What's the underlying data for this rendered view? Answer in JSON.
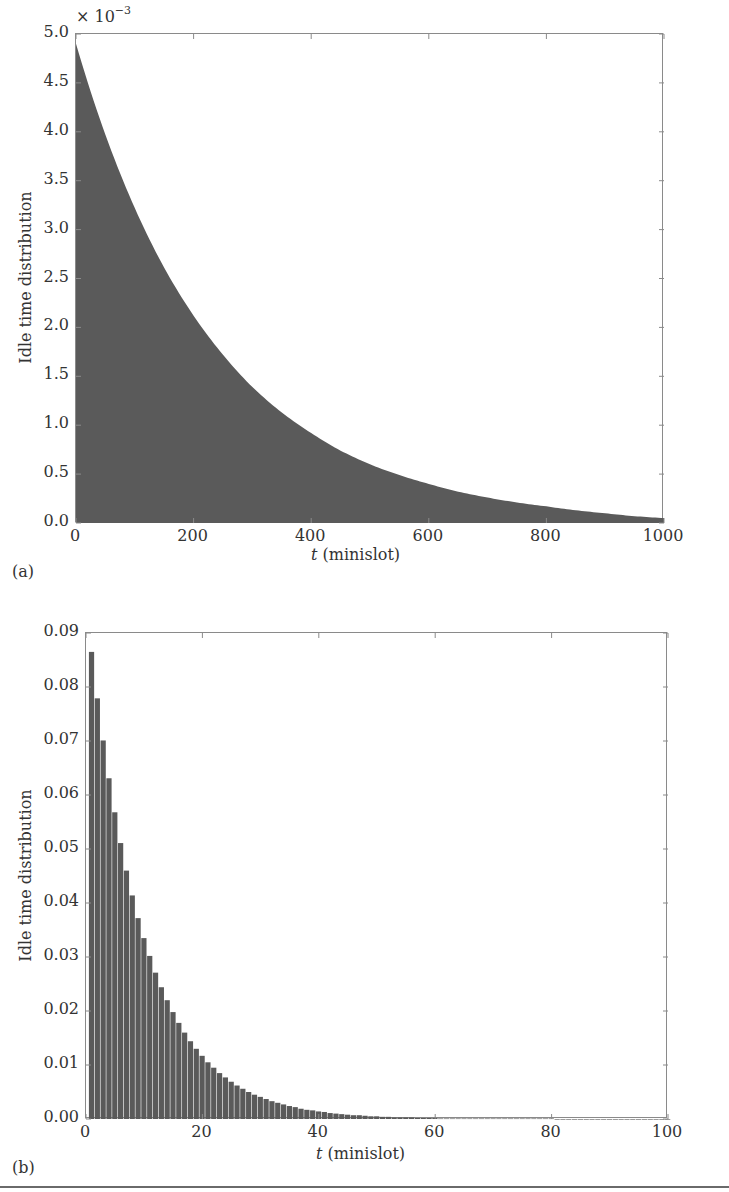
{
  "chart_data": [
    {
      "id": "a",
      "type": "area",
      "panel_label": "(a)",
      "title": "",
      "xlabel_italic": "t",
      "xlabel_rest": " (minislot)",
      "ylabel": "Idle time distribution",
      "y_multiplier_base": "× 10",
      "y_multiplier_exp": "−3",
      "xlim": [
        0,
        1000
      ],
      "ylim": [
        0,
        5.0
      ],
      "xticks": [
        "0",
        "200",
        "400",
        "600",
        "800",
        "1000"
      ],
      "xtick_values": [
        0,
        200,
        400,
        600,
        800,
        1000
      ],
      "yticks": [
        "0.0",
        "0.5",
        "1.0",
        "1.5",
        "2.0",
        "2.5",
        "3.0",
        "3.5",
        "4.0",
        "4.5",
        "5.0"
      ],
      "ytick_values": [
        0,
        0.5,
        1.0,
        1.5,
        2.0,
        2.5,
        3.0,
        3.5,
        4.0,
        4.5,
        5.0
      ],
      "grid": false,
      "fill_color": "#5a5a5a",
      "x": [
        0,
        50,
        100,
        150,
        200,
        250,
        300,
        350,
        400,
        450,
        500,
        550,
        600,
        650,
        700,
        750,
        800,
        850,
        900,
        950,
        1000
      ],
      "values": [
        4.9,
        3.97,
        3.22,
        2.61,
        2.12,
        1.72,
        1.39,
        1.13,
        0.92,
        0.74,
        0.6,
        0.49,
        0.4,
        0.32,
        0.26,
        0.21,
        0.17,
        0.13,
        0.1,
        0.07,
        0.05
      ]
    },
    {
      "id": "b",
      "type": "bar",
      "panel_label": "(b)",
      "title": "",
      "xlabel_italic": "t",
      "xlabel_rest": " (minislot)",
      "ylabel": "Idle time distribution",
      "xlim": [
        0,
        100
      ],
      "ylim": [
        0,
        0.09
      ],
      "xticks": [
        "0",
        "20",
        "40",
        "60",
        "80",
        "100"
      ],
      "xtick_values": [
        0,
        20,
        40,
        60,
        80,
        100
      ],
      "yticks": [
        "0.00",
        "0.01",
        "0.02",
        "0.03",
        "0.04",
        "0.05",
        "0.06",
        "0.07",
        "0.08",
        "0.09"
      ],
      "ytick_values": [
        0,
        0.01,
        0.02,
        0.03,
        0.04,
        0.05,
        0.06,
        0.07,
        0.08,
        0.09
      ],
      "grid": false,
      "bar_color": "#5a5a5a",
      "x_start": 1,
      "values": [
        0.0865,
        0.0779,
        0.0701,
        0.0631,
        0.0568,
        0.0511,
        0.046,
        0.0414,
        0.0372,
        0.0335,
        0.0302,
        0.0271,
        0.0244,
        0.022,
        0.0198,
        0.0178,
        0.016,
        0.0144,
        0.013,
        0.0117,
        0.0105,
        0.0095,
        0.0085,
        0.0077,
        0.0069,
        0.0062,
        0.0056,
        0.005,
        0.0045,
        0.0041,
        0.0037,
        0.0033,
        0.003,
        0.0027,
        0.0024,
        0.0022,
        0.0019,
        0.0017,
        0.0016,
        0.0014,
        0.0013,
        0.0011,
        0.001,
        0.0009,
        0.0008,
        0.0007,
        0.0007,
        0.0006,
        0.0005,
        0.0005,
        0.0004,
        0.0004,
        0.0003,
        0.0003,
        0.0003,
        0.0003,
        0.0002,
        0.0002,
        0.0002,
        0.0002,
        0.0001,
        0.0001,
        0.0001,
        0.0001,
        0.0001,
        0.0001,
        0.0001,
        0.0001,
        0.0001,
        0.0001,
        0.0001,
        0.0001,
        0.0001,
        0.0001,
        0.0001,
        0.0001,
        0.0001,
        0.0001,
        0.0001,
        0.0001,
        0.0,
        0.0,
        0.0,
        0.0,
        0.0,
        0.0,
        0.0,
        0.0,
        0.0,
        0.0,
        0.0,
        0.0,
        0.0,
        0.0,
        0.0,
        0.0,
        0.0,
        0.0,
        0.0,
        0.0
      ]
    }
  ]
}
